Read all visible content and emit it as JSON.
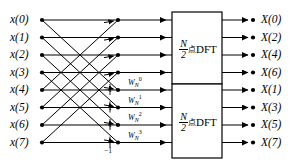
{
  "figure": {
    "type": "signal-flow-graph",
    "stroke_color": "#000000",
    "background_color": "#ffffff"
  },
  "inputs": {
    "labels": [
      "x(0)",
      "x(1)",
      "x(2)",
      "x(3)",
      "x(4)",
      "x(5)",
      "x(6)",
      "x(7)"
    ]
  },
  "outputs": {
    "labels": [
      "X(0)",
      "X(2)",
      "X(4)",
      "X(6)",
      "X(1)",
      "X(3)",
      "X(5)",
      "X(7)"
    ]
  },
  "twiddles": {
    "base": "W",
    "subscript": "N",
    "labels": [
      {
        "base": "W",
        "sub": "N",
        "sup": "0"
      },
      {
        "base": "W",
        "sub": "N",
        "sup": "1"
      },
      {
        "base": "W",
        "sub": "N",
        "sup": "2"
      },
      {
        "base": "W",
        "sub": "N",
        "sup": "3"
      }
    ]
  },
  "minus_ones": {
    "label": "−1",
    "count": 4
  },
  "blocks": [
    {
      "id": "dft-top",
      "numerator": "N",
      "denominator": "2",
      "cjk": "点",
      "word": "DFT",
      "outputs": [
        "X(0)",
        "X(2)",
        "X(4)",
        "X(6)"
      ]
    },
    {
      "id": "dft-bottom",
      "numerator": "N",
      "denominator": "2",
      "cjk": "点",
      "word": "DFT",
      "outputs": [
        "X(1)",
        "X(3)",
        "X(5)",
        "X(7)"
      ]
    }
  ],
  "geometry": {
    "rows_y": [
      20,
      37.5,
      55,
      72.5,
      90,
      107.5,
      125,
      142.5
    ],
    "input_node_x": 42,
    "mid_node_x": 118,
    "box_left": 172,
    "box_right": 222,
    "output_node_x": 253
  }
}
